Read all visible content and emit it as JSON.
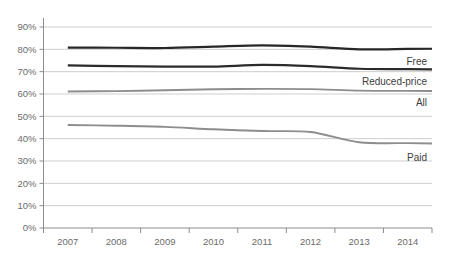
{
  "chart_data": {
    "type": "line",
    "title": "",
    "xlabel": "",
    "ylabel": "",
    "x": [
      "2007",
      "2008",
      "2009",
      "2010",
      "2011",
      "2012",
      "2013",
      "2014"
    ],
    "categories": [
      "2007",
      "2008",
      "2009",
      "2010",
      "2011",
      "2012",
      "2013",
      "2014"
    ],
    "ylim": [
      0,
      90
    ],
    "ytick_labels": [
      "0%",
      "10%",
      "20%",
      "30%",
      "40%",
      "50%",
      "60%",
      "70%",
      "80%",
      "90%"
    ],
    "ytick_values": [
      0,
      10,
      20,
      30,
      40,
      50,
      60,
      70,
      80,
      90
    ],
    "grid": true,
    "legend_position": "right-inline-labels",
    "series": [
      {
        "name": "Free",
        "label": "Free",
        "color": "#272727",
        "width": 2.2,
        "values": [
          80.8,
          80.7,
          80.6,
          81.2,
          81.8,
          81.2,
          80.0,
          80.2
        ]
      },
      {
        "name": "Reduced-price",
        "label": "Reduced-price",
        "color": "#2b2b2b",
        "width": 2.2,
        "values": [
          72.8,
          72.5,
          72.3,
          72.3,
          73.0,
          72.5,
          71.3,
          71.1
        ]
      },
      {
        "name": "All",
        "label": "All",
        "color": "#8d8d8d",
        "width": 1.9,
        "values": [
          61.1,
          61.3,
          61.7,
          62.1,
          62.3,
          62.2,
          61.5,
          61.4
        ]
      },
      {
        "name": "Paid",
        "label": "Paid",
        "color": "#8d8d8d",
        "width": 1.9,
        "values": [
          46.1,
          45.8,
          45.3,
          44.2,
          43.4,
          43.0,
          38.4,
          38.0
        ]
      }
    ]
  }
}
